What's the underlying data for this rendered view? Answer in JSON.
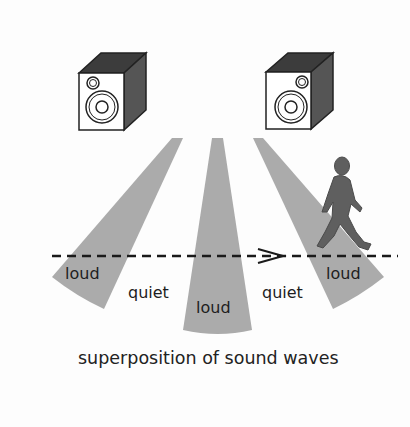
{
  "diagram": {
    "caption": "superposition of sound waves",
    "labels": {
      "loud_left": "loud",
      "quiet_left": "quiet",
      "loud_center": "loud",
      "quiet_right": "quiet",
      "loud_right": "loud"
    },
    "elements": {
      "speakers": [
        "speaker-left",
        "speaker-right"
      ],
      "beams": 3,
      "listener": "walking-person",
      "path": "dashed-line-with-arrow"
    },
    "colors": {
      "beam": "#ababab",
      "speaker_dark": "#4a4a4a",
      "person": "#5f5f5f",
      "line": "#1a1a1a"
    }
  }
}
